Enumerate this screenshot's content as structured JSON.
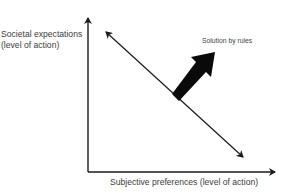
{
  "diagram": {
    "y_axis_label_line1": "Societal expectations",
    "y_axis_label_line2": "(level of action)",
    "x_axis_label": "Subjective preferences (level of action)",
    "annotation": "Solution by rules",
    "colors": {
      "line": "#1a1a1a",
      "text": "#3c3c3c",
      "background": "#ffffff"
    }
  }
}
